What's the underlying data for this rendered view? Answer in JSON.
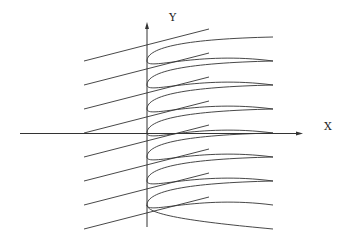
{
  "diagram": {
    "axes": {
      "x_label": "X",
      "y_label": "Y",
      "origin": [
        147,
        133.5
      ],
      "x_axis": {
        "from": 20,
        "to": 303
      },
      "y_axis": {
        "from": 227,
        "to": 22
      }
    },
    "stroke_color": "#333333",
    "lines": {
      "x_start": 84,
      "x_end": 209,
      "left_y": [
        61,
        85,
        109,
        133,
        157,
        181,
        205,
        229
      ],
      "right_y": [
        29,
        53,
        77,
        101,
        125,
        149,
        173,
        197
      ]
    },
    "curves": {
      "vertex_x": 147,
      "tip_x": 273,
      "vertices_y": [
        61,
        85,
        109,
        133,
        157,
        181,
        205
      ],
      "tips_y": [
        37,
        61,
        85,
        109,
        133,
        157,
        181,
        205,
        229
      ]
    }
  }
}
